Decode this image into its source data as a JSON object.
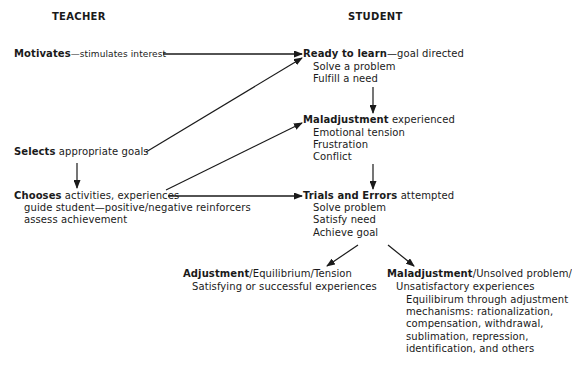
{
  "headers": {
    "teacher": "TEACHER",
    "student": "STUDENT"
  },
  "teacher": {
    "motivates": {
      "bold": "Motivates",
      "rest": "—stimulates interest"
    },
    "selects": {
      "bold": "Selects",
      "rest": " appropriate goals"
    },
    "chooses": {
      "bold": "Chooses",
      "rest": " activities, experiences",
      "lines": [
        "guide student—positive/negative reinforcers",
        "assess achievement"
      ]
    }
  },
  "student": {
    "ready": {
      "bold": "Ready to learn",
      "rest": "—goal directed",
      "lines": [
        "Solve a problem",
        "Fulfill a need"
      ]
    },
    "maladjustment_experienced": {
      "bold": "Maladjustment",
      "rest": " experienced",
      "lines": [
        "Emotional tension",
        "Frustration",
        "Conflict"
      ]
    },
    "trials": {
      "bold": "Trials and Errors",
      "rest": " attempted",
      "lines": [
        "Solve problem",
        "Satisfy need",
        "Achieve goal"
      ]
    }
  },
  "outcomes": {
    "adjustment": {
      "bold": "Adjustment",
      "rest": "/Equilibrium/Tension",
      "lines": [
        "Satisfying or successful experiences"
      ]
    },
    "maladjustment": {
      "bold": "Maladjustment",
      "rest": "/Unsolved problem/",
      "line1": "Unsatisfactory experiences",
      "lines": [
        "Equilibirum through adjustment",
        "mechanisms: rationalization,",
        "compensation, withdrawal,",
        "sublimation, repression,",
        "identification, and others"
      ]
    }
  },
  "colors": {
    "ink": "#1a1a1a",
    "background": "#ffffff"
  }
}
